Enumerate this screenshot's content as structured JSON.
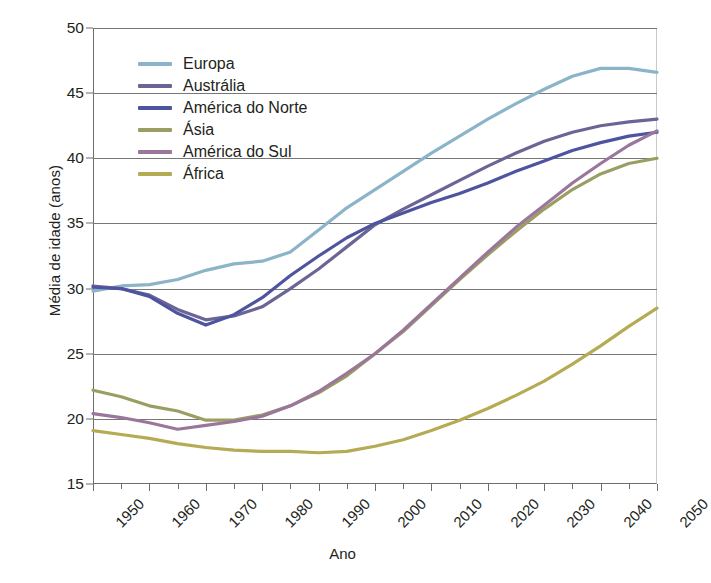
{
  "chart_data": {
    "type": "line",
    "title": "",
    "xlabel": "Ano",
    "ylabel": "Média de idade (anos)",
    "xlim": [
      1950,
      2050
    ],
    "ylim": [
      15,
      50
    ],
    "yticks": [
      15,
      20,
      25,
      30,
      35,
      40,
      45,
      50
    ],
    "grid": true,
    "legend_position": "upper-left-inside",
    "x": [
      1950,
      1955,
      1960,
      1965,
      1970,
      1975,
      1980,
      1985,
      1990,
      1995,
      2000,
      2005,
      2010,
      2015,
      2020,
      2025,
      2030,
      2035,
      2040,
      2045,
      2050
    ],
    "series": [
      {
        "name": "Europa",
        "color": "#8cb4c8",
        "values": [
          29.8,
          30.2,
          30.3,
          30.7,
          31.4,
          31.9,
          32.1,
          32.8,
          34.5,
          36.2,
          37.6,
          39.0,
          40.4,
          41.7,
          43.0,
          44.2,
          45.3,
          46.3,
          46.9,
          46.9,
          46.6
        ]
      },
      {
        "name": "Austrália",
        "color": "#6b6596",
        "values": [
          30.2,
          30.0,
          29.5,
          28.4,
          27.6,
          27.9,
          28.6,
          30.0,
          31.5,
          33.2,
          34.9,
          36.1,
          37.2,
          38.3,
          39.4,
          40.4,
          41.3,
          42.0,
          42.5,
          42.8,
          43.0
        ]
      },
      {
        "name": "América do Norte",
        "color": "#4e54a0",
        "values": [
          30.1,
          30.0,
          29.4,
          28.1,
          27.2,
          28.0,
          29.3,
          31.0,
          32.5,
          33.9,
          35.0,
          35.8,
          36.6,
          37.3,
          38.1,
          39.0,
          39.8,
          40.6,
          41.2,
          41.7,
          42.0
        ]
      },
      {
        "name": "Ásia",
        "color": "#9a9e62",
        "values": [
          22.2,
          21.7,
          21.0,
          20.6,
          19.9,
          19.9,
          20.3,
          21.0,
          22.0,
          23.3,
          25.0,
          26.7,
          28.7,
          30.7,
          32.6,
          34.4,
          36.1,
          37.6,
          38.8,
          39.6,
          40.0
        ]
      },
      {
        "name": "América do Sul",
        "color": "#9b769b",
        "values": [
          20.4,
          20.1,
          19.7,
          19.2,
          19.5,
          19.8,
          20.2,
          21.0,
          22.1,
          23.5,
          25.0,
          26.8,
          28.8,
          30.8,
          32.8,
          34.7,
          36.4,
          38.1,
          39.6,
          41.0,
          42.1
        ]
      },
      {
        "name": "África",
        "color": "#b5ab55",
        "values": [
          19.1,
          18.8,
          18.5,
          18.1,
          17.8,
          17.6,
          17.5,
          17.5,
          17.4,
          17.5,
          17.9,
          18.4,
          19.1,
          19.9,
          20.8,
          21.8,
          22.9,
          24.2,
          25.6,
          27.1,
          28.5
        ]
      }
    ],
    "xticks": [
      {
        "value": 1950,
        "label": "1950"
      },
      {
        "value": 1960,
        "label": "1960"
      },
      {
        "value": 1970,
        "label": "1970"
      },
      {
        "value": 1980,
        "label": "1980"
      },
      {
        "value": 1990,
        "label": "1990"
      },
      {
        "value": 2000,
        "label": "2000"
      },
      {
        "value": 2010,
        "label": "2010"
      },
      {
        "value": 2020,
        "label": "2020"
      },
      {
        "value": 2030,
        "label": "2030"
      },
      {
        "value": 2040,
        "label": "2040"
      },
      {
        "value": 2050,
        "label": "2050"
      }
    ]
  },
  "axis": {
    "y_title": "Média de idade (anos)",
    "x_title": "Ano"
  }
}
